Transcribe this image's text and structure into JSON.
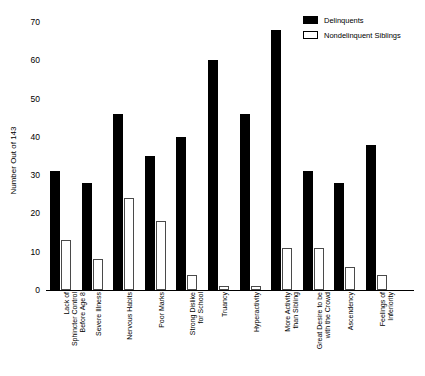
{
  "chart_data": {
    "type": "bar",
    "title": "",
    "xlabel": "",
    "ylabel": "Number Out of 143",
    "ylim": [
      0,
      70
    ],
    "yticks": [
      0,
      10,
      20,
      30,
      40,
      50,
      60,
      70
    ],
    "grid": false,
    "legend_position": "top-right",
    "categories": [
      "Lack of\nSphincter Control\nBefore Age 8",
      "Severe Illness",
      "Nervous Habits",
      "Poor Marks",
      "Strong Dislike\nfor School",
      "Truancy",
      "Hyperactivity",
      "More Activity\nthan Sibling",
      "Great Desire to be\nwith the Crowd",
      "Ascendency",
      "Feelings of\nInferiority"
    ],
    "series": [
      {
        "name": "Delinquents",
        "color": "#000000",
        "style": "filled",
        "values": [
          31,
          28,
          46,
          35,
          40,
          60,
          46,
          68,
          31,
          28,
          38
        ]
      },
      {
        "name": "Nondelinquent Siblings",
        "color": "#ffffff",
        "style": "hollow",
        "values": [
          13,
          8,
          24,
          18,
          4,
          1,
          1,
          11,
          11,
          6,
          4
        ]
      }
    ]
  },
  "legend": {
    "items": [
      {
        "label": "Delinquents",
        "style": "filled"
      },
      {
        "label": "Nondelinquent Siblings",
        "style": "hollow"
      }
    ]
  },
  "axis": {
    "y_title": "Number Out of 143",
    "y_tick_labels": [
      "70",
      "60",
      "50",
      "40",
      "30",
      "20",
      "10",
      "0"
    ]
  }
}
